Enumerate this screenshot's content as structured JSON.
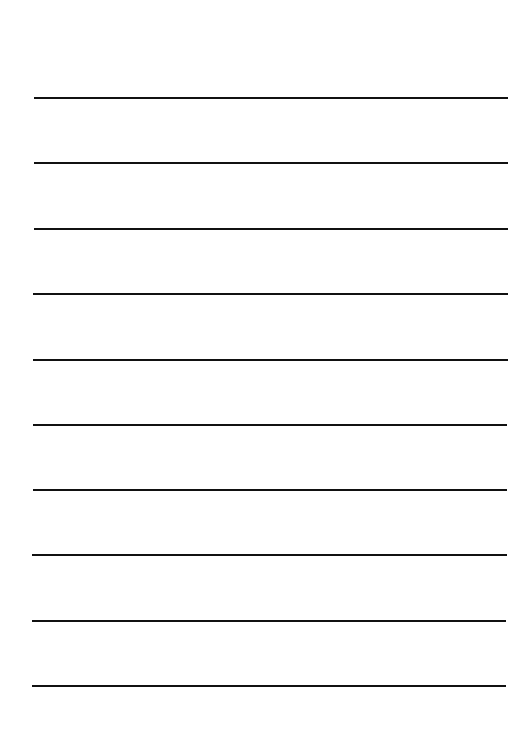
{
  "page": {
    "background": "#ffffff",
    "line_color": "#111111",
    "line_thickness": 2,
    "lines": [
      {
        "y": 97,
        "x1": 34,
        "x2": 508
      },
      {
        "y": 162,
        "x1": 34,
        "x2": 508
      },
      {
        "y": 228,
        "x1": 34,
        "x2": 508
      },
      {
        "y": 293,
        "x1": 33,
        "x2": 508
      },
      {
        "y": 359,
        "x1": 33,
        "x2": 508
      },
      {
        "y": 424,
        "x1": 33,
        "x2": 507
      },
      {
        "y": 489,
        "x1": 33,
        "x2": 507
      },
      {
        "y": 554,
        "x1": 32,
        "x2": 507
      },
      {
        "y": 620,
        "x1": 32,
        "x2": 506
      },
      {
        "y": 685,
        "x1": 32,
        "x2": 506
      }
    ]
  }
}
